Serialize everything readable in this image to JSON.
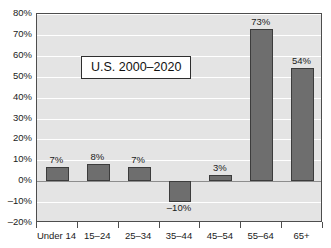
{
  "chart_data": {
    "type": "bar",
    "title": "",
    "xlabel": "",
    "ylabel": "",
    "categories": [
      "Under 14",
      "15–24",
      "25–34",
      "35–44",
      "45–54",
      "55–64",
      "65+"
    ],
    "values": [
      7,
      8,
      7,
      -10,
      3,
      73,
      54
    ],
    "value_labels": [
      "7%",
      "8%",
      "7%",
      "–10%",
      "3%",
      "73%",
      "54%"
    ],
    "ylim": [
      -20,
      80
    ],
    "ytick_values": [
      80,
      70,
      60,
      50,
      40,
      30,
      20,
      10,
      0,
      -10,
      -20
    ],
    "ytick_labels": [
      "80%",
      "70%",
      "60%",
      "50%",
      "40%",
      "30%",
      "20%",
      "10%",
      "0%",
      "–10%",
      "–20%"
    ],
    "grid": true,
    "grid_orientation": "horizontal",
    "legend": false,
    "legend_position": "none",
    "annotations": [
      {
        "name": "period-callout",
        "text": "U.S. 2000–2020"
      }
    ],
    "colors": {
      "bar_fill": "#6e6e6e",
      "bar_edge": "#3c3c3c",
      "plot_background": "#e4e4e4",
      "gridline": "#ffffff",
      "axis": "#4d4d4d",
      "text": "#1b1b1b",
      "annotation_background": "#ffffff",
      "annotation_border": "#2e2e2e"
    }
  }
}
